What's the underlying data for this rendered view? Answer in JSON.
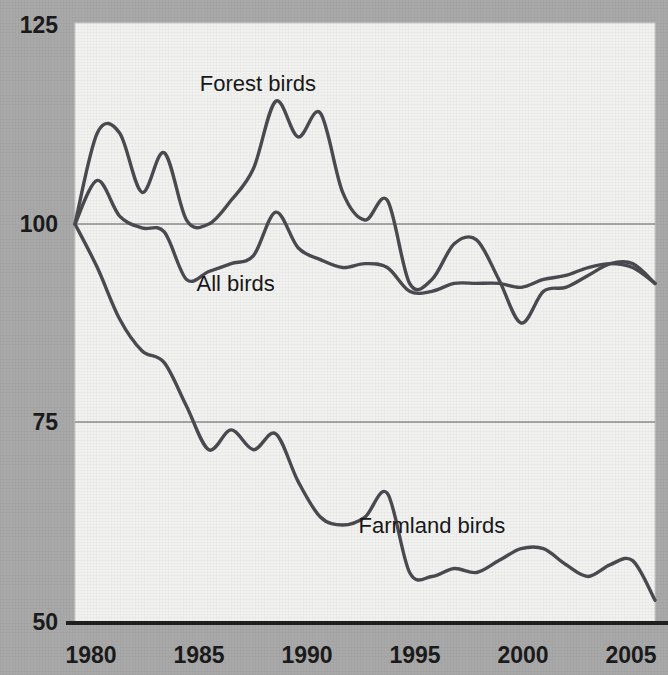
{
  "chart_data": {
    "type": "line",
    "title": "",
    "xlabel": "",
    "ylabel": "",
    "xlim": [
      1980,
      2006
    ],
    "ylim": [
      50,
      125
    ],
    "yticks": [
      50,
      75,
      100,
      125
    ],
    "xticks": [
      1980,
      1985,
      1990,
      1995,
      2000,
      2005
    ],
    "ytick_labels": [
      "50",
      "75",
      "100",
      "125"
    ],
    "xtick_labels": [
      "1980",
      "1985",
      "1990",
      "1995",
      "2000",
      "2005"
    ],
    "grid": "horizontal gridlines at 75 and 100",
    "legend": "inline labels on plot",
    "index_base": "1980 = 100",
    "line_color": "#4a4a50",
    "series": [
      {
        "name": "Forest birds",
        "label_x": 1988.2,
        "label_y": 116.8,
        "x": [
          1980,
          1981,
          1982,
          1983,
          1984,
          1985,
          1986,
          1987,
          1988,
          1989,
          1990,
          1991,
          1992,
          1993,
          1994,
          1995,
          1996,
          1997,
          1998,
          1999,
          2000,
          2001,
          2002,
          2003,
          2004,
          2005,
          2006
        ],
        "values": [
          100,
          111.5,
          111.5,
          104,
          109,
          100.5,
          100,
          103,
          107,
          115.5,
          111,
          114,
          104,
          100.5,
          103,
          92.5,
          93,
          97.5,
          98,
          93,
          87.5,
          91.5,
          92,
          93.5,
          95,
          95,
          92.5
        ]
      },
      {
        "name": "All birds",
        "label_x": 1987.2,
        "label_y": 91.5,
        "x": [
          1980,
          1981,
          1982,
          1983,
          1984,
          1985,
          1986,
          1987,
          1988,
          1989,
          1990,
          1991,
          1992,
          1993,
          1994,
          1995,
          1996,
          1997,
          1998,
          1999,
          2000,
          2001,
          2002,
          2003,
          2004,
          2005,
          2006
        ],
        "values": [
          100,
          105.5,
          101,
          99.5,
          99,
          93,
          94,
          95,
          96,
          101.5,
          97,
          95.5,
          94.5,
          95,
          94.5,
          91.5,
          91.5,
          92.5,
          92.5,
          92.5,
          92,
          93,
          93.5,
          94.5,
          95,
          94.5,
          92.5
        ]
      },
      {
        "name": "Farmland birds",
        "label_x": 1996.0,
        "label_y": 61.0,
        "x": [
          1980,
          1981,
          1982,
          1983,
          1984,
          1985,
          1986,
          1987,
          1988,
          1989,
          1990,
          1991,
          1992,
          1993,
          1994,
          1995,
          1996,
          1997,
          1998,
          1999,
          2000,
          2001,
          2002,
          2003,
          2004,
          2005,
          2006
        ],
        "values": [
          100,
          94.5,
          88,
          84,
          82.5,
          77,
          71.5,
          74,
          71.5,
          73.5,
          67.5,
          63,
          62,
          63,
          66,
          56,
          55.5,
          56.5,
          56,
          57.5,
          59,
          59,
          57,
          55.5,
          57,
          57.5,
          52.5
        ]
      }
    ]
  },
  "axis": {
    "y_label_125": "125",
    "y_label_100": "100",
    "y_label_75": "75",
    "y_label_50": "50",
    "x_label_1980": "1980",
    "x_label_1985": "1985",
    "x_label_1990": "1990",
    "x_label_1995": "1995",
    "x_label_2000": "2000",
    "x_label_2005": "2005"
  },
  "labels": {
    "forest": "Forest birds",
    "all": "All birds",
    "farmland": "Farmland birds"
  }
}
